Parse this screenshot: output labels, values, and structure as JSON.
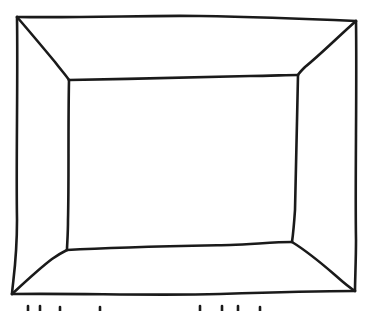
{
  "diagram": {
    "type": "hand-drawn room/frame perspective",
    "stroke_color": "#1a1a1a",
    "background": "#ffffff",
    "outer_rect": {
      "top_left": [
        17,
        17
      ],
      "top_right": [
        356,
        21
      ],
      "bottom_right": [
        355,
        291
      ],
      "bottom_left": [
        12,
        294
      ]
    },
    "inner_rect": {
      "top_left": [
        69,
        80
      ],
      "top_right": [
        298,
        75
      ],
      "bottom_right": [
        292,
        242
      ],
      "bottom_left": [
        67,
        250
      ]
    },
    "caption": ""
  }
}
